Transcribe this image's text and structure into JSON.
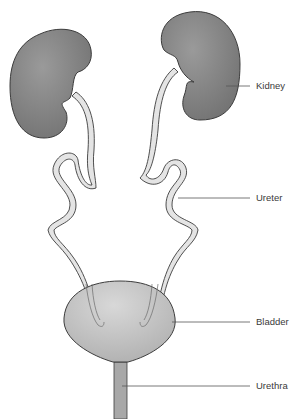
{
  "diagram": {
    "colors": {
      "kidney": "#7a7a7a",
      "kidney_highlight": "#9a9a9a",
      "ureter": "#e4e4e4",
      "bladder": "#bdbdbd",
      "bladder_highlight": "#d6d6d6",
      "urethra": "#a8a8a8",
      "outline": "#3c3c3c",
      "leader_line": "#555555",
      "label_text": "#3a3a3a"
    },
    "labels": [
      {
        "id": "kidney",
        "text": "Kidney",
        "x": 256,
        "y": 82
      },
      {
        "id": "ureter",
        "text": "Ureter",
        "x": 256,
        "y": 194
      },
      {
        "id": "bladder",
        "text": "Bladder",
        "x": 256,
        "y": 318
      },
      {
        "id": "urethra",
        "text": "Urethra",
        "x": 256,
        "y": 382
      }
    ]
  }
}
